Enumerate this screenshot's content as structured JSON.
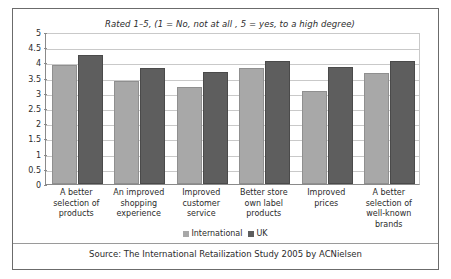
{
  "chart_data": {
    "type": "bar",
    "title": "Rated 1–5, (1 = No, not at all , 5 = yes, to a high degree)",
    "xlabel": "",
    "ylabel": "",
    "ylim": [
      0,
      5
    ],
    "ytick_labels": [
      "5",
      "4.5",
      "4",
      "3.5",
      "3",
      "2.5",
      "2",
      "1.5",
      "1",
      "0.5",
      "0"
    ],
    "ytick_values": [
      5,
      4.5,
      4,
      3.5,
      3,
      2.5,
      2,
      1.5,
      1,
      0.5,
      0
    ],
    "grid": true,
    "legend_position": "bottom",
    "categories": [
      "A better selection of products",
      "An improved shopping experience",
      "Improved customer service",
      "Better store own label products",
      "Improved prices",
      "A better selection of well-known brands"
    ],
    "category_lines": [
      [
        "A better",
        "selection of",
        "products"
      ],
      [
        "An improved",
        "shopping",
        "experience"
      ],
      [
        "Improved",
        "customer",
        "service"
      ],
      [
        "Better store",
        "own label",
        "products"
      ],
      [
        "Improved",
        "prices"
      ],
      [
        "A better",
        "selection of",
        "well-known",
        "brands"
      ]
    ],
    "series": [
      {
        "name": "International",
        "color": "#a8a8a8",
        "values": [
          3.9,
          3.4,
          3.2,
          3.8,
          3.05,
          3.65
        ]
      },
      {
        "name": "UK",
        "color": "#5e5e5e",
        "values": [
          4.25,
          3.8,
          3.7,
          4.05,
          3.85,
          4.05
        ]
      }
    ]
  },
  "footer": {
    "source": "Source: The International Retailization Study 2005 by ACNielsen"
  }
}
